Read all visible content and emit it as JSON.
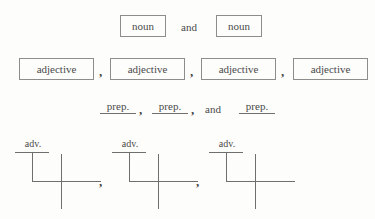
{
  "page": {
    "type": "grammar-worksheet",
    "background_color": "#fdfdfc",
    "ink_color": "#444444",
    "rule_color": "#6f6f6f",
    "box_border_color": "#8d8d8d"
  },
  "rows": {
    "noun_row": {
      "boxes": [
        {
          "label": "noun"
        },
        {
          "label": "noun"
        }
      ],
      "conjunction": "and"
    },
    "adjective_row": {
      "boxes": [
        {
          "label": "adjective"
        },
        {
          "label": "adjective"
        },
        {
          "label": "adjective"
        },
        {
          "label": "adjective"
        }
      ],
      "separators": [
        ",",
        ",",
        ","
      ]
    },
    "preposition_row": {
      "items": [
        {
          "label": "prep."
        },
        {
          "label": "prep."
        },
        {
          "label": "prep."
        }
      ],
      "separators": [
        ",",
        ","
      ],
      "conjunction": "and"
    },
    "diagram_row": {
      "diagrams": [
        {
          "modifier_label": "adv."
        },
        {
          "modifier_label": "adv."
        },
        {
          "modifier_label": "adv."
        }
      ],
      "separators": [
        ",",
        ","
      ]
    }
  }
}
